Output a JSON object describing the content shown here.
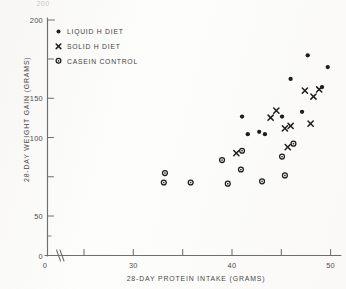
{
  "chart_data": {
    "type": "scatter",
    "title": "",
    "xlabel": "28-DAY PROTEIN INTAKE (GRAMS)",
    "ylabel": "28-DAY WEIGHT GAIN (GRAMS)",
    "xlim": [
      0,
      51.5
    ],
    "ylim": [
      0,
      205
    ],
    "grid": false,
    "axis_break_x": true,
    "legend_position": "upper-left-inside",
    "x_ticks_labeled": [
      {
        "value": 0,
        "label": "0"
      },
      {
        "value": 30,
        "label": "30"
      },
      {
        "value": 40,
        "label": "40"
      },
      {
        "value": 50,
        "label": "50"
      }
    ],
    "x_ticks_minor": [
      20,
      25,
      30,
      35,
      40,
      45,
      50
    ],
    "y_ticks_labeled": [
      {
        "value": 0,
        "label": "0"
      },
      {
        "value": 50,
        "label": "50"
      },
      {
        "value": 100,
        "label": "100"
      },
      {
        "value": 150,
        "label": "150"
      },
      {
        "value": 200,
        "label": "200"
      }
    ],
    "y_ticks_minor": [
      25,
      75,
      125,
      175
    ],
    "clipped_top_label": "200",
    "series": [
      {
        "name": "LIQUID H DIET",
        "marker": "filled-circle",
        "points": [
          [
            34.5,
            118
          ],
          [
            35.5,
            103
          ],
          [
            37.5,
            105
          ],
          [
            38.5,
            103
          ],
          [
            41.5,
            118
          ],
          [
            43.0,
            150
          ],
          [
            45.0,
            122
          ],
          [
            46.0,
            170
          ],
          [
            48.5,
            143
          ],
          [
            49.5,
            160
          ],
          [
            43.5,
            95
          ]
        ]
      },
      {
        "name": "SOLID H DIET",
        "marker": "cross",
        "points": [
          [
            33.5,
            87
          ],
          [
            39.5,
            117
          ],
          [
            40.5,
            123
          ],
          [
            42.0,
            108
          ],
          [
            43.0,
            110
          ],
          [
            45.5,
            140
          ],
          [
            46.5,
            112
          ],
          [
            47.0,
            135
          ],
          [
            48.0,
            141
          ],
          [
            42.5,
            92
          ]
        ]
      },
      {
        "name": "CASEIN CONTROL",
        "marker": "open-circle",
        "points": [
          [
            21.0,
            70
          ],
          [
            20.8,
            62
          ],
          [
            25.5,
            62
          ],
          [
            31.0,
            81
          ],
          [
            34.5,
            89
          ],
          [
            34.3,
            73
          ],
          [
            32.0,
            61
          ],
          [
            41.5,
            84
          ],
          [
            43.5,
            95
          ],
          [
            38.0,
            63
          ],
          [
            42.0,
            68
          ]
        ]
      }
    ]
  },
  "legend": {
    "entries": [
      {
        "label": "LIQUID H DIET",
        "marker": "filled-circle"
      },
      {
        "label": "SOLID H DIET",
        "marker": "cross"
      },
      {
        "label": "CASEIN CONTROL",
        "marker": "open-circle"
      }
    ]
  }
}
